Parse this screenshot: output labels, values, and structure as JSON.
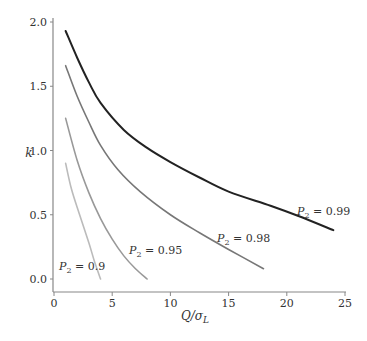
{
  "chart_data": {
    "type": "line",
    "title": "",
    "xlabel": "Q/σL",
    "xlabel_parts": {
      "main": "Q/σ",
      "sub": "L"
    },
    "ylabel": "k",
    "xlim": [
      0,
      25
    ],
    "ylim": [
      0,
      2.0
    ],
    "x_ticks": [
      0,
      5,
      10,
      15,
      20,
      25
    ],
    "x_tick_labels": [
      "0",
      "5",
      "10",
      "15",
      "20",
      "25"
    ],
    "y_ticks": [
      0.0,
      0.5,
      1.0,
      1.5,
      2.0
    ],
    "y_tick_labels": [
      "0.0",
      "0.5",
      "1.0",
      "1.5",
      "2.0"
    ],
    "grid": false,
    "legend": "inline labels",
    "series": [
      {
        "name": "P2 = 0.99",
        "label_prefix": "P",
        "label_sub": "2",
        "label_value": " = 0.99",
        "color": "#222222",
        "x": [
          1,
          2,
          3,
          4,
          6,
          8,
          10,
          12.5,
          15,
          18.6,
          21,
          24
        ],
        "y": [
          1.93,
          1.72,
          1.53,
          1.37,
          1.16,
          1.02,
          0.91,
          0.79,
          0.68,
          0.57,
          0.49,
          0.38
        ]
      },
      {
        "name": "P2 = 0.98",
        "label_prefix": "P",
        "label_sub": "2",
        "label_value": " = 0.98",
        "color": "#777777",
        "x": [
          1,
          2,
          3,
          4,
          5.5,
          7.4,
          10,
          12.5,
          15,
          18
        ],
        "y": [
          1.66,
          1.42,
          1.22,
          1.04,
          0.85,
          0.68,
          0.5,
          0.36,
          0.23,
          0.08
        ]
      },
      {
        "name": "P2 = 0.95",
        "label_prefix": "P",
        "label_sub": "2",
        "label_value": " = 0.95",
        "color": "#999999",
        "x": [
          1,
          2,
          3,
          4,
          5,
          6,
          7,
          8
        ],
        "y": [
          1.25,
          0.92,
          0.67,
          0.47,
          0.31,
          0.18,
          0.08,
          0.0
        ]
      },
      {
        "name": "P2 = 0.9",
        "label_prefix": "P",
        "label_sub": "2",
        "label_value": " = 0.9",
        "color": "#bbbbbb",
        "x": [
          1,
          1.5,
          2.2,
          3,
          3.5,
          4
        ],
        "y": [
          0.9,
          0.7,
          0.5,
          0.28,
          0.13,
          0.0
        ]
      }
    ],
    "label_positions": [
      {
        "x": 297,
        "y": 215
      },
      {
        "x": 217,
        "y": 242
      },
      {
        "x": 129,
        "y": 254
      },
      {
        "x": 59,
        "y": 270
      }
    ]
  }
}
